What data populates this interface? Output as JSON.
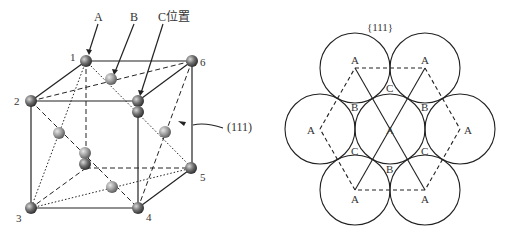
{
  "cube": {
    "labels": {
      "a": "A",
      "b": "B",
      "c": "C位置",
      "plane": "(111)"
    },
    "corners": [
      "1",
      "2",
      "3",
      "4",
      "5",
      "6"
    ]
  },
  "packing": {
    "title": "{111}",
    "labels": {
      "a": "A",
      "b": "B",
      "c": "C"
    }
  }
}
